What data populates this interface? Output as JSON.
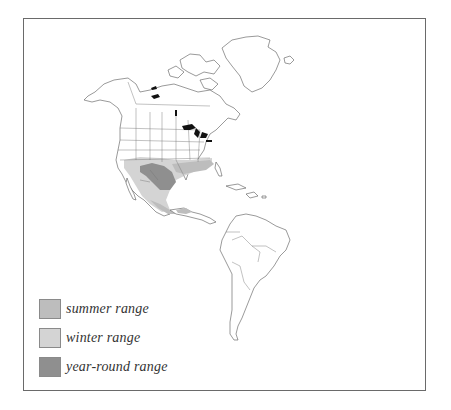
{
  "map": {
    "title": "",
    "region": "The Americas",
    "frame_color": "#6a6a6a",
    "colors": {
      "summer": "#bdbdbd",
      "winter": "#d4d4d4",
      "year_round": "#8f8f8f",
      "lakes": "#111111"
    }
  },
  "legend": {
    "items": [
      {
        "label": "summer range",
        "color": "#bdbdbd"
      },
      {
        "label": "winter range",
        "color": "#d4d4d4"
      },
      {
        "label": "year-round range",
        "color": "#8f8f8f"
      }
    ]
  }
}
